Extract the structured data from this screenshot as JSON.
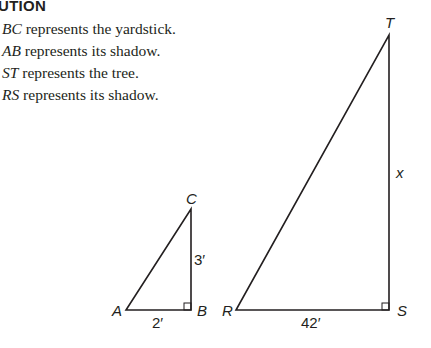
{
  "heading": "UTION",
  "statements": [
    {
      "segment": "BC",
      "text": " represents the yardstick."
    },
    {
      "segment": "AB",
      "text": " represents its shadow."
    },
    {
      "segment": "ST",
      "text": " represents the tree."
    },
    {
      "segment": "RS",
      "text": " represents its shadow."
    }
  ],
  "small_triangle": {
    "vertices": {
      "A": "A",
      "B": "B",
      "C": "C"
    },
    "height_label": "3′",
    "base_label": "2′"
  },
  "large_triangle": {
    "vertices": {
      "R": "R",
      "S": "S",
      "T": "T"
    },
    "height_label": "x",
    "base_label": "42′"
  }
}
